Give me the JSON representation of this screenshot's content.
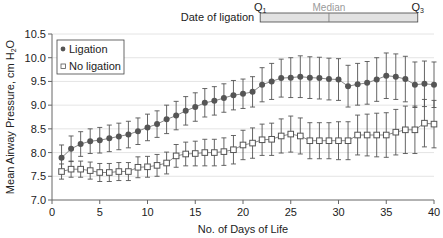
{
  "chart_data": {
    "type": "line",
    "title": "",
    "xlabel": "No. of Days of Life",
    "ylabel": "Mean Airway Pressure, cm H2O",
    "ylabel_main": "Mean Airway Pressure, cm H",
    "ylabel_sub": "2",
    "ylabel_end": "O",
    "xlim": [
      0,
      40
    ],
    "ylim": [
      7.0,
      10.5
    ],
    "xticks": [
      0,
      5,
      10,
      15,
      20,
      25,
      30,
      35,
      40
    ],
    "yticks": [
      "7.0",
      "7.5",
      "8.0",
      "8.5",
      "9.0",
      "9.5",
      "10.0",
      "10.5"
    ],
    "grid": "horizontal",
    "legend_position": "upper left",
    "x": [
      1,
      2,
      3,
      4,
      5,
      6,
      7,
      8,
      9,
      10,
      11,
      12,
      13,
      14,
      15,
      16,
      17,
      18,
      19,
      20,
      21,
      22,
      23,
      24,
      25,
      26,
      27,
      28,
      29,
      30,
      31,
      32,
      33,
      34,
      35,
      36,
      37,
      38,
      39,
      40
    ],
    "series": [
      {
        "name": "Ligation",
        "marker": "filled-circle",
        "color": "#555555",
        "values": [
          7.89,
          8.08,
          8.18,
          8.24,
          8.26,
          8.3,
          8.34,
          8.38,
          8.45,
          8.53,
          8.6,
          8.7,
          8.78,
          8.88,
          8.96,
          9.05,
          9.09,
          9.15,
          9.21,
          9.24,
          9.28,
          9.43,
          9.5,
          9.57,
          9.58,
          9.6,
          9.58,
          9.57,
          9.55,
          9.54,
          9.4,
          9.44,
          9.47,
          9.54,
          9.62,
          9.6,
          9.55,
          9.43,
          9.45,
          9.43
        ],
        "errors": [
          0.27,
          0.27,
          0.26,
          0.26,
          0.27,
          0.28,
          0.28,
          0.28,
          0.28,
          0.28,
          0.28,
          0.3,
          0.3,
          0.3,
          0.3,
          0.3,
          0.3,
          0.3,
          0.31,
          0.31,
          0.32,
          0.36,
          0.38,
          0.4,
          0.42,
          0.44,
          0.44,
          0.44,
          0.44,
          0.44,
          0.44,
          0.44,
          0.45,
          0.46,
          0.48,
          0.48,
          0.48,
          0.48,
          0.48,
          0.48
        ]
      },
      {
        "name": "No ligation",
        "marker": "open-square",
        "color": "#555555",
        "values": [
          7.6,
          7.65,
          7.65,
          7.62,
          7.58,
          7.58,
          7.6,
          7.6,
          7.69,
          7.7,
          7.73,
          7.78,
          7.93,
          7.97,
          7.98,
          8.0,
          8.0,
          8.02,
          8.06,
          8.16,
          8.2,
          8.27,
          8.28,
          8.35,
          8.39,
          8.35,
          8.25,
          8.25,
          8.25,
          8.25,
          8.25,
          8.37,
          8.37,
          8.37,
          8.37,
          8.43,
          8.48,
          8.48,
          8.62,
          8.6
        ],
        "errors": [
          0.16,
          0.17,
          0.17,
          0.18,
          0.19,
          0.19,
          0.19,
          0.19,
          0.22,
          0.22,
          0.23,
          0.23,
          0.24,
          0.25,
          0.26,
          0.28,
          0.28,
          0.29,
          0.3,
          0.31,
          0.32,
          0.33,
          0.34,
          0.36,
          0.38,
          0.38,
          0.38,
          0.38,
          0.38,
          0.4,
          0.4,
          0.42,
          0.44,
          0.46,
          0.47,
          0.48,
          0.5,
          0.5,
          0.5,
          0.5
        ]
      }
    ],
    "annotation": {
      "label": "Date of ligation",
      "q1_label": "Q",
      "q1_sub": "1",
      "q3_label": "Q",
      "q3_sub": "3",
      "median_label": "Median",
      "q1_day": 21.8,
      "median_day": 29.0,
      "q3_day": 38.3
    }
  },
  "legend": {
    "items": [
      {
        "label": "Ligation",
        "marker": "filled-circle"
      },
      {
        "label": "No ligation",
        "marker": "open-square"
      }
    ]
  },
  "colors": {
    "axis": "#666666",
    "grid": "#dddddd",
    "series": "#555555",
    "iqr_bar_fill": "#e2e2e2",
    "median_text": "#9a9a9a",
    "text": "#222222"
  }
}
